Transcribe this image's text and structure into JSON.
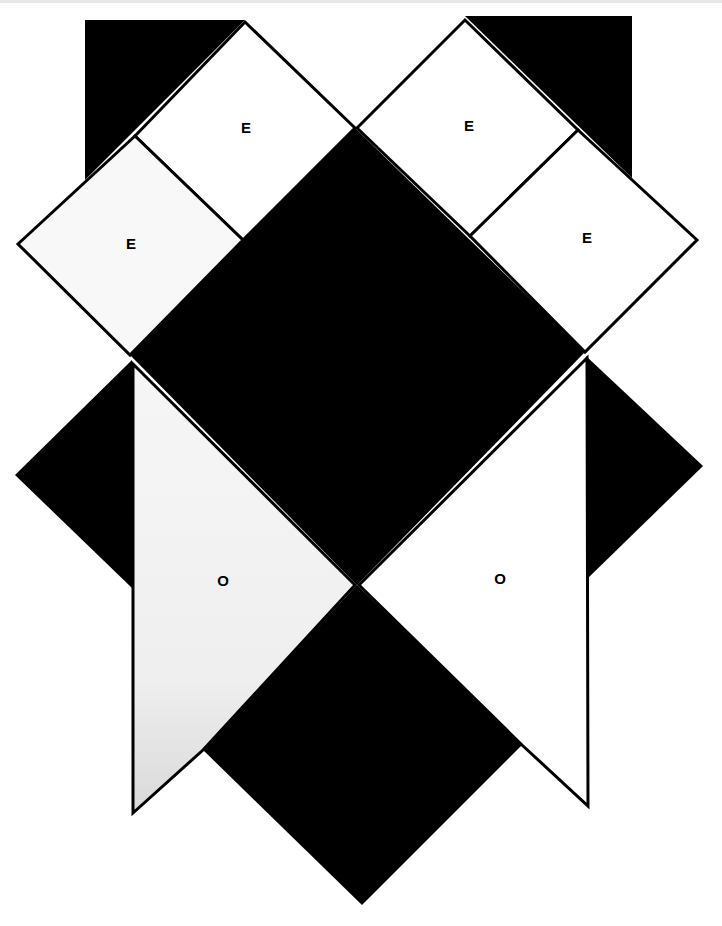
{
  "diagram": {
    "title": "",
    "colors": {
      "background": "#ffffff",
      "fill_dark": "#000000",
      "fill_light": "#ffffff",
      "fill_light_shaded": "#f2f2f2",
      "stroke": "#000000"
    },
    "labels": {
      "e_top_left": "E",
      "e_top_right": "E",
      "e_outer_left": "E",
      "e_outer_right": "E",
      "o_left": "O",
      "o_right": "O"
    },
    "pieces": [
      {
        "id": "black-triangle-top-left",
        "fill": "dark"
      },
      {
        "id": "black-triangle-top-right",
        "fill": "dark"
      },
      {
        "id": "square-e-top-left",
        "fill": "light",
        "label": "E"
      },
      {
        "id": "square-e-top-right",
        "fill": "light",
        "label": "E"
      },
      {
        "id": "square-e-outer-left",
        "fill": "light",
        "label": "E"
      },
      {
        "id": "square-e-outer-right",
        "fill": "light",
        "label": "E"
      },
      {
        "id": "central-black-diamond",
        "fill": "dark"
      },
      {
        "id": "black-triangle-left",
        "fill": "dark"
      },
      {
        "id": "black-triangle-right",
        "fill": "dark"
      },
      {
        "id": "kite-o-left",
        "fill": "light",
        "label": "O"
      },
      {
        "id": "kite-o-right",
        "fill": "light",
        "label": "O"
      },
      {
        "id": "bottom-black-diamond",
        "fill": "dark"
      }
    ]
  }
}
